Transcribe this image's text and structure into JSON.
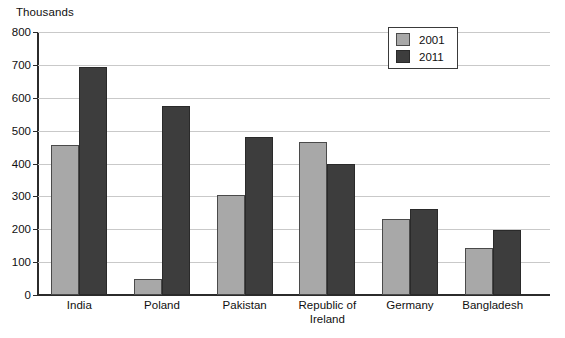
{
  "chart_data": {
    "type": "bar",
    "title": "",
    "subtitle": "",
    "unit_caption": "Thousands",
    "xlabel": "",
    "ylabel": "",
    "ylim": [
      0,
      800
    ],
    "y_ticks": [
      0,
      100,
      200,
      300,
      400,
      500,
      600,
      700,
      800
    ],
    "grid": true,
    "legend_position": "top-right",
    "categories": [
      "India",
      "Poland",
      "Pakistan",
      "Republic of\nIreland",
      "Germany",
      "Bangladesh"
    ],
    "series": [
      {
        "name": "2001",
        "color": "#a8a8a8",
        "values": [
          455,
          50,
          303,
          465,
          230,
          143
        ]
      },
      {
        "name": "2011",
        "color": "#3d3d3d",
        "values": [
          693,
          575,
          482,
          400,
          262,
          198
        ]
      }
    ]
  },
  "legend": {
    "entries": [
      {
        "label": "2001"
      },
      {
        "label": "2011"
      }
    ]
  },
  "colors": {
    "series_2001": "#a8a8a8",
    "series_2011": "#3d3d3d",
    "gridline": "#c9c9c9",
    "axis": "#2b2b2b",
    "text": "#101010",
    "background": "#ffffff"
  }
}
